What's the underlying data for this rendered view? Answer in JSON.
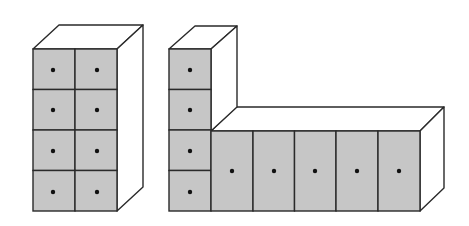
{
  "diagram": {
    "title": "",
    "colors": {
      "drawer_fill": "#c6c6c6",
      "edge": "#2a2a2a",
      "knob": "#111111",
      "side_face": "#ffffff"
    },
    "figures": [
      {
        "name": "tall-cabinet",
        "layout": "2 columns x 4 rows",
        "drawer_count": 8,
        "front": {
          "x": 33,
          "y": 49,
          "w": 84,
          "h": 162
        },
        "depth_offset": {
          "dx": 26,
          "dy": -24
        },
        "columns": 2,
        "rows": 4
      },
      {
        "name": "l-shaped-cabinet",
        "layout": "1 column x 4 rows tower + 5 tall drawers low section",
        "drawer_count": 9,
        "tower": {
          "x": 169,
          "y": 49,
          "w": 42,
          "h": 162,
          "rows": 4
        },
        "low_section": {
          "x": 211,
          "y": 131,
          "w": 209,
          "h": 80,
          "columns": 5
        },
        "depth_offset": {
          "dx": 25,
          "dy": -24
        }
      }
    ]
  }
}
